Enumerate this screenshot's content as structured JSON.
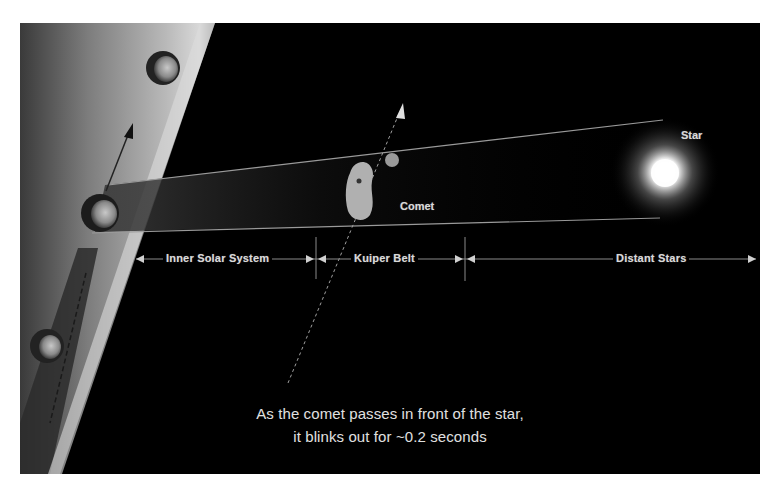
{
  "figure": {
    "labels": {
      "star": "Star",
      "comet": "Comet"
    },
    "distance_axis": {
      "segments": [
        {
          "label": "Inner Solar System"
        },
        {
          "label": "Kuiper Belt"
        },
        {
          "label": "Distant Stars"
        }
      ]
    },
    "caption": {
      "line1": "As the comet passes in front of the star,",
      "line2": "it blinks out for ~0.2 seconds"
    },
    "colors": {
      "background": "#000000",
      "planet_band": "#b8b8b8",
      "text": "#d9d9d9",
      "star_glow": "#ffffff"
    }
  }
}
